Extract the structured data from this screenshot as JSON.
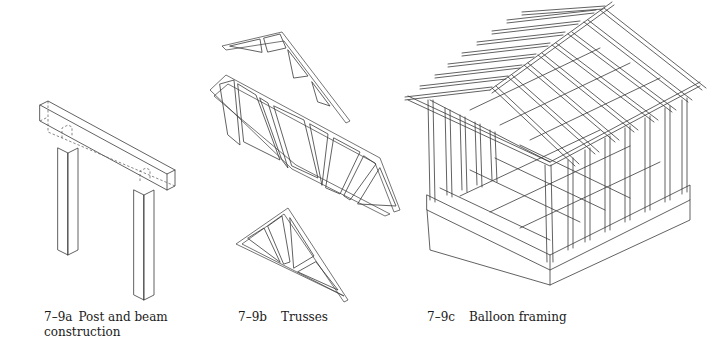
{
  "figures": [
    {
      "id": "7-9a",
      "number": "7–9a",
      "title_line1": "Post and beam",
      "title_line2": "construction",
      "subject": "post-and-beam"
    },
    {
      "id": "7-9b",
      "number": "7–9b",
      "title_line1": "Trusses",
      "subject": "trusses"
    },
    {
      "id": "7-9c",
      "number": "7–9c",
      "title_line1": "Balloon framing",
      "subject": "balloon-framing"
    }
  ]
}
